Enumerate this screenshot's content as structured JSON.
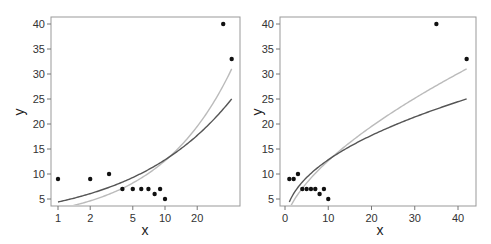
{
  "chart_data": [
    {
      "type": "scatter",
      "title": "",
      "xlabel": "x",
      "ylabel": "y",
      "xscale": "log",
      "xticks": [
        1,
        2,
        5,
        10,
        20
      ],
      "yticks": [
        5,
        10,
        15,
        20,
        25,
        30,
        35,
        40
      ],
      "xlim": [
        0.87,
        50
      ],
      "ylim": [
        3.5,
        41.5
      ],
      "grid": false,
      "legend": null,
      "points": [
        {
          "x": 1,
          "y": 9
        },
        {
          "x": 2,
          "y": 9
        },
        {
          "x": 3,
          "y": 10
        },
        {
          "x": 4,
          "y": 7
        },
        {
          "x": 5,
          "y": 7
        },
        {
          "x": 6,
          "y": 7
        },
        {
          "x": 7,
          "y": 7
        },
        {
          "x": 8,
          "y": 6
        },
        {
          "x": 9,
          "y": 7
        },
        {
          "x": 10,
          "y": 5
        },
        {
          "x": 35,
          "y": 40
        },
        {
          "x": 42,
          "y": 33
        }
      ],
      "series": [
        {
          "name": "fit-dark",
          "color": "#555555",
          "formula": "y = 4.4 * x^0.465",
          "x_range": [
            1,
            42
          ],
          "y_at_ends": [
            4.4,
            25
          ]
        },
        {
          "name": "fit-light",
          "color": "#bbbbbb",
          "formula": "y = 3.0 * x^0.625",
          "x_range": [
            1,
            42
          ],
          "y_at_ends": [
            3.0,
            31
          ]
        }
      ]
    },
    {
      "type": "scatter",
      "title": "",
      "xlabel": "x",
      "ylabel": "y",
      "xscale": "linear",
      "xticks": [
        0,
        10,
        20,
        30,
        40
      ],
      "yticks": [
        5,
        10,
        15,
        20,
        25,
        30,
        35,
        40
      ],
      "xlim": [
        -1,
        44
      ],
      "ylim": [
        3.5,
        41.5
      ],
      "grid": false,
      "legend": null,
      "points": [
        {
          "x": 1,
          "y": 9
        },
        {
          "x": 2,
          "y": 9
        },
        {
          "x": 3,
          "y": 10
        },
        {
          "x": 4,
          "y": 7
        },
        {
          "x": 5,
          "y": 7
        },
        {
          "x": 6,
          "y": 7
        },
        {
          "x": 7,
          "y": 7
        },
        {
          "x": 8,
          "y": 6
        },
        {
          "x": 9,
          "y": 7
        },
        {
          "x": 10,
          "y": 5
        },
        {
          "x": 35,
          "y": 40
        },
        {
          "x": 42,
          "y": 33
        }
      ],
      "series": [
        {
          "name": "fit-dark",
          "color": "#555555",
          "formula": "y = 4.4 * x^0.465",
          "x_range": [
            1,
            42
          ],
          "y_at_ends": [
            4.4,
            25
          ]
        },
        {
          "name": "fit-light",
          "color": "#bbbbbb",
          "formula": "y = 3.0 * x^0.625",
          "x_range": [
            1.4,
            42
          ],
          "y_at_ends": [
            3.7,
            31
          ]
        }
      ]
    }
  ],
  "labels": {
    "left": {
      "xlabel": "x",
      "ylabel": "y",
      "xticks": [
        "1",
        "2",
        "5",
        "10",
        "20"
      ],
      "yticks": [
        "5",
        "10",
        "15",
        "20",
        "25",
        "30",
        "35",
        "40"
      ]
    },
    "right": {
      "xlabel": "x",
      "ylabel": "y",
      "xticks": [
        "0",
        "10",
        "20",
        "30",
        "40"
      ],
      "yticks": [
        "5",
        "10",
        "15",
        "20",
        "25",
        "30",
        "35",
        "40"
      ]
    }
  }
}
